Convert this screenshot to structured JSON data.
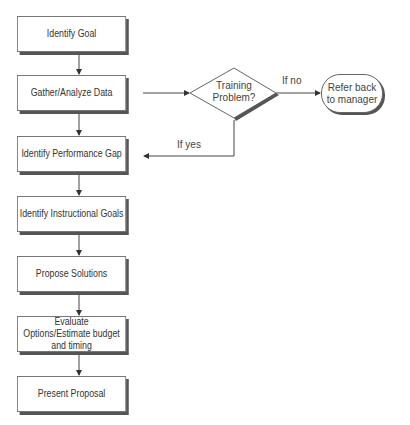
{
  "flowchart": {
    "steps": [
      {
        "label": "Identify Goal"
      },
      {
        "label": "Gather/Analyze Data"
      },
      {
        "label": "Identify Performance Gap"
      },
      {
        "label": "Identify Instructional Goals"
      },
      {
        "label": "Propose Solutions"
      },
      {
        "label": "Evaluate Options/Estimate budget and timing"
      },
      {
        "label": "Present Proposal"
      }
    ],
    "decision": {
      "line1": "Training",
      "line2": "Problem?"
    },
    "terminator": {
      "line1": "Refer back",
      "line2": "to manager"
    },
    "edges": {
      "no_label": "If no",
      "yes_label": "If yes"
    }
  },
  "colors": {
    "line": "#444444",
    "shadow": "#555555",
    "background": "#ffffff"
  }
}
